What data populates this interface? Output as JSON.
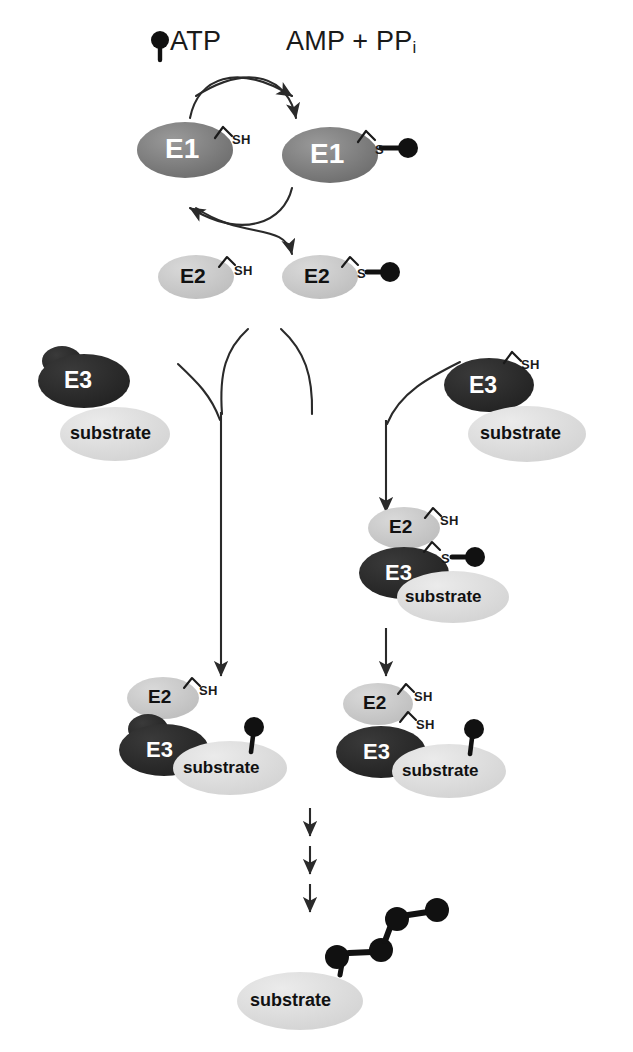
{
  "diagram": {
    "colors": {
      "e1_fill": "#767676",
      "e2_fill": "#c9c9c9",
      "e3_fill": "#2b2b2b",
      "substrate_fill": "#dcdcdc",
      "ubiquitin_fill": "#111111",
      "stroke": "#2a2a2a",
      "text_light": "#ffffff",
      "text_dark": "#111111",
      "background": "#ffffff"
    },
    "top_labels": {
      "atp": "ATP",
      "products": "AMP + PP",
      "products_subscript": "i"
    },
    "enzymes": {
      "e1": "E1",
      "e2": "E2",
      "e3": "E3",
      "substrate": "substrate"
    },
    "thiol_labels": {
      "free": "SH",
      "bound": "S"
    },
    "nodes": [
      {
        "id": "e1-free",
        "type": "E1",
        "label": "E1",
        "thiol": "SH",
        "ubiquitin": false
      },
      {
        "id": "e1-ub",
        "type": "E1",
        "label": "E1",
        "thiol": "S",
        "ubiquitin": true
      },
      {
        "id": "e2-free",
        "type": "E2",
        "label": "E2",
        "thiol": "SH",
        "ubiquitin": false
      },
      {
        "id": "e2-ub",
        "type": "E2",
        "label": "E2",
        "thiol": "S",
        "ubiquitin": true
      },
      {
        "id": "e3-ring",
        "type": "E3",
        "label": "E3",
        "thiol": null,
        "ubiquitin": false
      },
      {
        "id": "substrate-ring",
        "type": "substrate",
        "label": "substrate",
        "thiol": null,
        "ubiquitin": false
      },
      {
        "id": "e3-hect",
        "type": "E3",
        "label": "E3",
        "thiol": "SH",
        "ubiquitin": false
      },
      {
        "id": "substrate-hect",
        "type": "substrate",
        "label": "substrate",
        "thiol": null,
        "ubiquitin": false
      },
      {
        "id": "e2-hect-cplx",
        "type": "E2",
        "label": "E2",
        "thiol": "SH",
        "ubiquitin": false
      },
      {
        "id": "e3-hect-cplx",
        "type": "E3",
        "label": "E3",
        "thiol": "S",
        "ubiquitin": true
      },
      {
        "id": "substrate-hect-cplx",
        "type": "substrate",
        "label": "substrate",
        "thiol": null,
        "ubiquitin": false
      },
      {
        "id": "e2-left-out",
        "type": "E2",
        "label": "E2",
        "thiol": "SH",
        "ubiquitin": false
      },
      {
        "id": "e3-left-out",
        "type": "E3",
        "label": "E3",
        "thiol": null,
        "ubiquitin": false
      },
      {
        "id": "substrate-left-out",
        "type": "substrate",
        "label": "substrate",
        "thiol": null,
        "ubiquitin": true
      },
      {
        "id": "e2-right-out",
        "type": "E2",
        "label": "E2",
        "thiol": "SH",
        "ubiquitin": false
      },
      {
        "id": "e3-right-out",
        "type": "E3",
        "label": "E3",
        "thiol": "SH",
        "ubiquitin": false
      },
      {
        "id": "substrate-right-out",
        "type": "substrate",
        "label": "substrate",
        "thiol": null,
        "ubiquitin": true
      },
      {
        "id": "substrate-poly",
        "type": "substrate",
        "label": "substrate",
        "thiol": null,
        "ubiquitin": true
      }
    ],
    "polyubiquitin_chain_length": 4,
    "iteration_arrow_count": 3,
    "icons": {
      "ubiquitin": "ubiquitin-icon",
      "arrow": "arrow-icon",
      "curved_arrow": "curved-arrow-icon"
    }
  }
}
